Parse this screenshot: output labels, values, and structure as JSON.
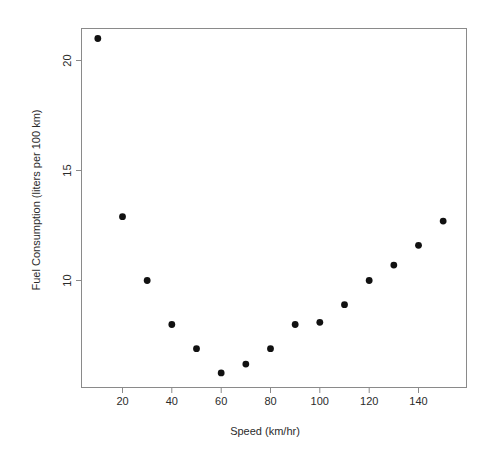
{
  "chart_data": {
    "type": "scatter",
    "title": "",
    "xlabel": "Speed (km/hr)",
    "ylabel": "Fuel Consumption (liters per 100 km)",
    "x": [
      10,
      20,
      30,
      40,
      50,
      60,
      70,
      80,
      90,
      100,
      110,
      120,
      130,
      140,
      150
    ],
    "values": [
      21.0,
      12.9,
      10.0,
      8.0,
      6.9,
      5.8,
      6.2,
      6.9,
      8.0,
      8.1,
      8.9,
      10.0,
      10.7,
      11.6,
      12.7
    ],
    "series": [
      {
        "name": "Fuel Consumption",
        "values": [
          21.0,
          12.9,
          10.0,
          8.0,
          6.9,
          5.8,
          6.2,
          6.9,
          8.0,
          8.1,
          8.9,
          10.0,
          10.7,
          11.6,
          12.7
        ]
      }
    ],
    "xlim": [
      5,
      156
    ],
    "ylim": [
      5.2,
      21.5
    ],
    "xticks": [
      20,
      40,
      60,
      80,
      100,
      120,
      140
    ],
    "xtick_labels": [
      "20",
      "40",
      "60",
      "80",
      "100",
      "120",
      "140"
    ],
    "yticks": [
      10,
      15,
      20
    ],
    "ytick_labels": [
      "10",
      "15",
      "20"
    ],
    "grid": false,
    "legend": "none",
    "marker": "filled-circle",
    "marker_color": "#111111",
    "frame_color": "#8a8a8a",
    "background": "#ffffff"
  },
  "axes": {
    "x_axis_label": "Speed (km/hr)",
    "y_axis_label": "Fuel Consumption (liters per 100 km)"
  }
}
